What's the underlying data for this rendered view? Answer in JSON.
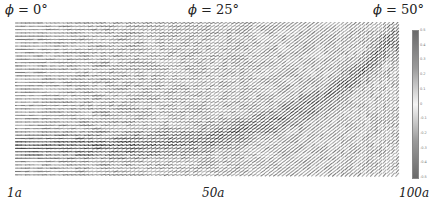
{
  "chart_data": {
    "type": "heatmap",
    "title": "",
    "column_labels": [
      "φ = 0°",
      "φ = 25°",
      "φ = 50°"
    ],
    "phi_values_deg": [
      0,
      25,
      50
    ],
    "x_tick_labels": [
      "1a",
      "50a",
      "100a"
    ],
    "xlabel": "",
    "ylabel": "",
    "colorbar": {
      "ticks": [
        0.5,
        0.4,
        0.3,
        0.2,
        0.1,
        0,
        -0.1,
        -0.2,
        -0.3,
        -0.4,
        -0.5
      ],
      "range": [
        -0.5,
        0.5
      ],
      "colormap": "grayscale (dark at extremes, light at 0)"
    },
    "band_path": [
      {
        "x_frac": 0.0,
        "y_frac": 0.8
      },
      {
        "x_frac": 0.3,
        "y_frac": 0.8
      },
      {
        "x_frac": 0.5,
        "y_frac": 0.76
      },
      {
        "x_frac": 0.65,
        "y_frac": 0.66
      },
      {
        "x_frac": 0.8,
        "y_frac": 0.5
      },
      {
        "x_frac": 0.9,
        "y_frac": 0.32
      },
      {
        "x_frac": 0.97,
        "y_frac": 0.12
      }
    ]
  },
  "labels": {
    "col0": {
      "phi": "ϕ",
      "eq": " = 0°"
    },
    "col1": {
      "phi": "ϕ",
      "eq": " = 25°"
    },
    "col2": {
      "phi": "ϕ",
      "eq": " = 50°"
    },
    "x0": "1a",
    "x1": "50a",
    "x2": "100a"
  },
  "colorbar_ticks": [
    "0.5",
    "0.4",
    "0.3",
    "0.2",
    "0.1",
    "0",
    "-0.1",
    "-0.2",
    "-0.3",
    "-0.4",
    "-0.5"
  ]
}
